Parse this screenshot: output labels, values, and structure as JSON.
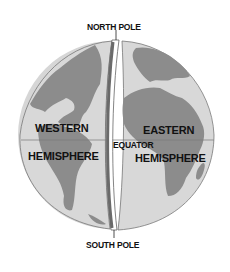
{
  "diagram": {
    "labels": {
      "north_pole": "NORTH POLE",
      "south_pole": "SOUTH POLE",
      "equator": "EQUATOR",
      "western_line1": "WESTERN",
      "western_line2": "HEMISPHERE",
      "eastern_line1": "EASTERN",
      "eastern_line2": "HEMISPHERE"
    },
    "colors": {
      "ocean": "#d6d6d6",
      "land": "#8a8a8a",
      "outline": "#6a6a6a",
      "text": "#111111"
    }
  }
}
